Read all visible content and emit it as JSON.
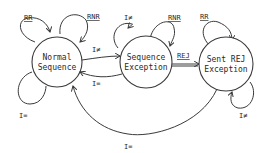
{
  "diagram": {
    "type": "state-transition",
    "states": [
      {
        "id": "normal",
        "line1": "Normal",
        "line2": "Sequence"
      },
      {
        "id": "seqexc",
        "line1": "Sequence",
        "line2": "Exception"
      },
      {
        "id": "sentrej",
        "line1": "Sent REJ",
        "line2": "Exception"
      }
    ],
    "labels": {
      "normal_rr": "RR",
      "normal_rnr": "RNR",
      "normal_ieq": "I=",
      "normal_to_seq": "I≠",
      "seq_to_normal": "I=",
      "seq_ineq": "I≠",
      "seq_rnr": "RNR",
      "seq_to_rej": "REJ",
      "rej_rr": "RR",
      "rej_ineq": "I≠",
      "rej_to_normal": "I="
    }
  }
}
